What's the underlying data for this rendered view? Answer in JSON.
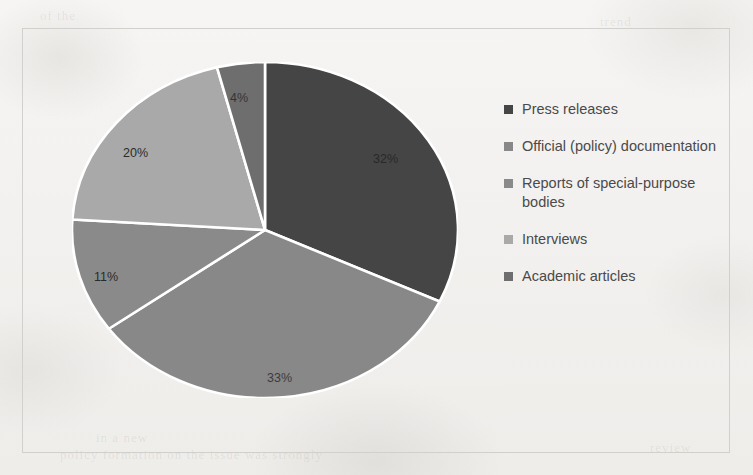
{
  "chart_data": {
    "type": "pie",
    "title": "",
    "categories": [
      "Press releases",
      "Official (policy) documentation",
      "Reports of special-purpose bodies",
      "Interviews",
      "Academic articles"
    ],
    "values": [
      32,
      33,
      11,
      20,
      4
    ],
    "value_labels": [
      "32%",
      "33%",
      "11%",
      "20%",
      "4%"
    ],
    "unit": "%",
    "legend_position": "right",
    "grid": false,
    "colors": [
      "#454545",
      "#888888",
      "#8a8a8a",
      "#a9a9a9",
      "#6e6e6e"
    ],
    "slice_separator_color": "#ffffff",
    "start_angle_deg": 0,
    "direction": "clockwise"
  },
  "legend": {
    "items": [
      {
        "label": "Press releases",
        "color": "#454545"
      },
      {
        "label": "Official (policy) documentation",
        "color": "#888888"
      },
      {
        "label": "Reports of special-purpose bodies",
        "color": "#8a8a8a"
      },
      {
        "label": "Interviews",
        "color": "#a9a9a9"
      },
      {
        "label": "Academic articles",
        "color": "#6e6e6e"
      }
    ]
  },
  "slice_labels": [
    {
      "text": "32%",
      "x": 373,
      "y": 152,
      "dark": true
    },
    {
      "text": "33%",
      "x": 267,
      "y": 371,
      "dark": true
    },
    {
      "text": "11%",
      "x": 94,
      "y": 270,
      "dark": false
    },
    {
      "text": "20%",
      "x": 123,
      "y": 146,
      "dark": false
    },
    {
      "text": "4%",
      "x": 230,
      "y": 91,
      "dark": true
    }
  ],
  "ghost_text": [
    {
      "text": "of the",
      "x": 40,
      "y": 8
    },
    {
      "text": "trend",
      "x": 600,
      "y": 14
    },
    {
      "text": "in a new",
      "x": 96,
      "y": 430
    },
    {
      "text": "policy formation on the issue was strongly",
      "x": 60,
      "y": 447
    },
    {
      "text": "review",
      "x": 650,
      "y": 440
    }
  ],
  "frame": {
    "border_color": "#d2d0cd"
  },
  "page": {
    "background": "#f4f3f1"
  }
}
